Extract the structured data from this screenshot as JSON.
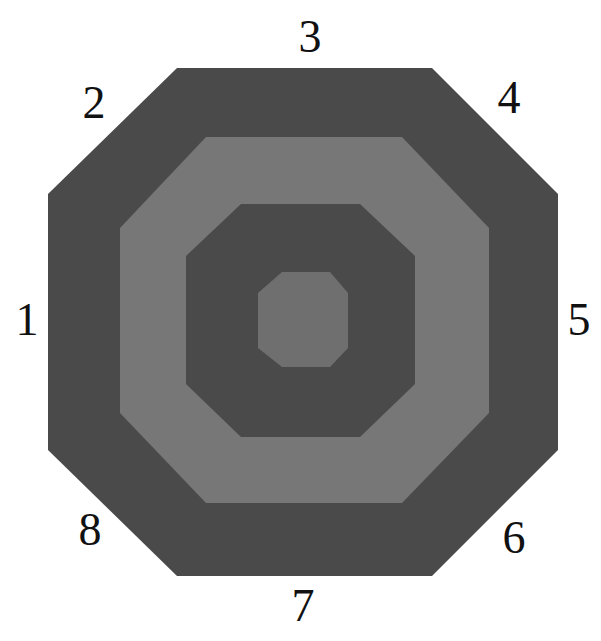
{
  "diagram": {
    "colors": {
      "background": "#ffffff",
      "outer_ring": "#4a4a4a",
      "second_ring": "#777777",
      "third_ring": "#4a4a4a",
      "center": "#6f6f6f",
      "label_color": "#111111"
    },
    "octagons": [
      {
        "name": "outer",
        "fill": "#4a4a4a",
        "points": "177,68 432,68 558,194 558,450 432,576 177,576 48,450 48,194"
      },
      {
        "name": "second",
        "fill": "#777777",
        "points": "206,137 402,137 489,228 489,413 402,503 206,503 120,413 120,228"
      },
      {
        "name": "third",
        "fill": "#4a4a4a",
        "points": "241,204 360,204 415,256 415,384 360,437 241,437 186,384 186,256"
      },
      {
        "name": "center",
        "fill": "#6f6f6f",
        "points": "282,272 330,272 348,293 348,348 330,367 282,367 258,348 258,293"
      }
    ],
    "labels": [
      {
        "text": "1",
        "x": 27,
        "y": 320
      },
      {
        "text": "2",
        "x": 94,
        "y": 103
      },
      {
        "text": "3",
        "x": 310,
        "y": 37
      },
      {
        "text": "4",
        "x": 509,
        "y": 98
      },
      {
        "text": "5",
        "x": 579,
        "y": 320
      },
      {
        "text": "6",
        "x": 514,
        "y": 538
      },
      {
        "text": "7",
        "x": 303,
        "y": 606
      },
      {
        "text": "8",
        "x": 90,
        "y": 530
      }
    ]
  }
}
